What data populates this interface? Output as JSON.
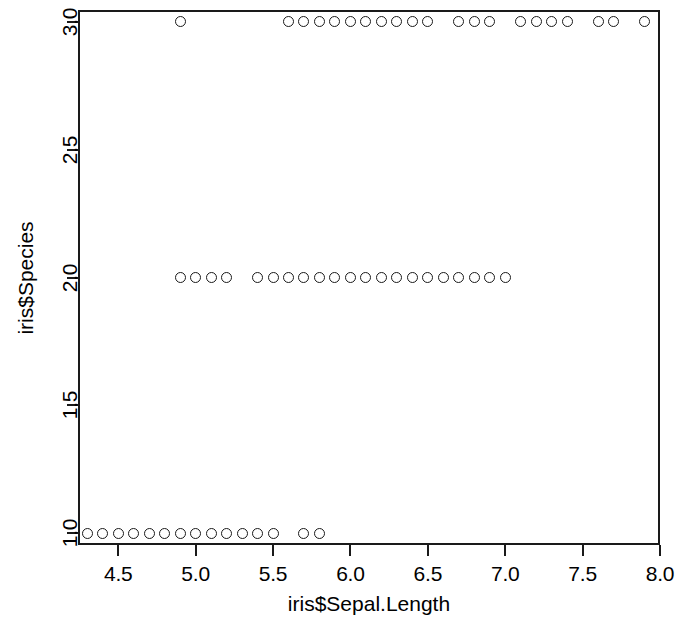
{
  "chart_data": {
    "type": "scatter",
    "title": "",
    "xlabel": "iris$Sepal.Length",
    "ylabel": "iris$Species",
    "xlim": [
      4.24,
      8.0
    ],
    "ylim": [
      0.955,
      3.045
    ],
    "grid": false,
    "legend": null,
    "marker": "open-circle",
    "marker_color": "#1a1a1a",
    "xticks": [
      {
        "value": 4.5,
        "label": "4.5"
      },
      {
        "value": 5.0,
        "label": "5.0"
      },
      {
        "value": 5.5,
        "label": "5.5"
      },
      {
        "value": 6.0,
        "label": "6.0"
      },
      {
        "value": 6.5,
        "label": "6.5"
      },
      {
        "value": 7.0,
        "label": "7.0"
      },
      {
        "value": 7.5,
        "label": "7.5"
      },
      {
        "value": 8.0,
        "label": "8.0"
      }
    ],
    "yticks": [
      {
        "value": 1.0,
        "label": "1.0"
      },
      {
        "value": 1.5,
        "label": "1.5"
      },
      {
        "value": 2.0,
        "label": "2.0"
      },
      {
        "value": 2.5,
        "label": "2.5"
      },
      {
        "value": 3.0,
        "label": "3.0"
      }
    ],
    "series": [
      {
        "name": "setosa",
        "y": 1,
        "x": [
          4.3,
          4.4,
          4.5,
          4.6,
          4.7,
          4.8,
          4.9,
          5.0,
          5.1,
          5.2,
          5.3,
          5.4,
          5.5,
          5.7,
          5.8
        ]
      },
      {
        "name": "versicolor",
        "y": 2,
        "x": [
          4.9,
          5.0,
          5.1,
          5.2,
          5.4,
          5.5,
          5.6,
          5.7,
          5.8,
          5.9,
          6.0,
          6.1,
          6.2,
          6.3,
          6.4,
          6.5,
          6.6,
          6.7,
          6.8,
          6.9,
          7.0
        ]
      },
      {
        "name": "virginica",
        "y": 3,
        "x": [
          4.9,
          5.6,
          5.7,
          5.8,
          5.9,
          6.0,
          6.1,
          6.2,
          6.3,
          6.4,
          6.5,
          6.7,
          6.8,
          6.9,
          7.1,
          7.2,
          7.3,
          7.4,
          7.6,
          7.7,
          7.9
        ]
      }
    ],
    "points": [
      {
        "x": 4.3,
        "y": 1
      },
      {
        "x": 4.4,
        "y": 1
      },
      {
        "x": 4.5,
        "y": 1
      },
      {
        "x": 4.6,
        "y": 1
      },
      {
        "x": 4.7,
        "y": 1
      },
      {
        "x": 4.8,
        "y": 1
      },
      {
        "x": 4.9,
        "y": 1
      },
      {
        "x": 5.0,
        "y": 1
      },
      {
        "x": 5.1,
        "y": 1
      },
      {
        "x": 5.2,
        "y": 1
      },
      {
        "x": 5.3,
        "y": 1
      },
      {
        "x": 5.4,
        "y": 1
      },
      {
        "x": 5.5,
        "y": 1
      },
      {
        "x": 5.7,
        "y": 1
      },
      {
        "x": 5.8,
        "y": 1
      },
      {
        "x": 4.9,
        "y": 2
      },
      {
        "x": 5.0,
        "y": 2
      },
      {
        "x": 5.1,
        "y": 2
      },
      {
        "x": 5.2,
        "y": 2
      },
      {
        "x": 5.4,
        "y": 2
      },
      {
        "x": 5.5,
        "y": 2
      },
      {
        "x": 5.6,
        "y": 2
      },
      {
        "x": 5.7,
        "y": 2
      },
      {
        "x": 5.8,
        "y": 2
      },
      {
        "x": 5.9,
        "y": 2
      },
      {
        "x": 6.0,
        "y": 2
      },
      {
        "x": 6.1,
        "y": 2
      },
      {
        "x": 6.2,
        "y": 2
      },
      {
        "x": 6.3,
        "y": 2
      },
      {
        "x": 6.4,
        "y": 2
      },
      {
        "x": 6.5,
        "y": 2
      },
      {
        "x": 6.6,
        "y": 2
      },
      {
        "x": 6.7,
        "y": 2
      },
      {
        "x": 6.8,
        "y": 2
      },
      {
        "x": 6.9,
        "y": 2
      },
      {
        "x": 7.0,
        "y": 2
      },
      {
        "x": 4.9,
        "y": 3
      },
      {
        "x": 5.6,
        "y": 3
      },
      {
        "x": 5.7,
        "y": 3
      },
      {
        "x": 5.8,
        "y": 3
      },
      {
        "x": 5.9,
        "y": 3
      },
      {
        "x": 6.0,
        "y": 3
      },
      {
        "x": 6.1,
        "y": 3
      },
      {
        "x": 6.2,
        "y": 3
      },
      {
        "x": 6.3,
        "y": 3
      },
      {
        "x": 6.4,
        "y": 3
      },
      {
        "x": 6.5,
        "y": 3
      },
      {
        "x": 6.7,
        "y": 3
      },
      {
        "x": 6.8,
        "y": 3
      },
      {
        "x": 6.9,
        "y": 3
      },
      {
        "x": 7.1,
        "y": 3
      },
      {
        "x": 7.2,
        "y": 3
      },
      {
        "x": 7.3,
        "y": 3
      },
      {
        "x": 7.4,
        "y": 3
      },
      {
        "x": 7.6,
        "y": 3
      },
      {
        "x": 7.7,
        "y": 3
      },
      {
        "x": 7.9,
        "y": 3
      }
    ]
  }
}
